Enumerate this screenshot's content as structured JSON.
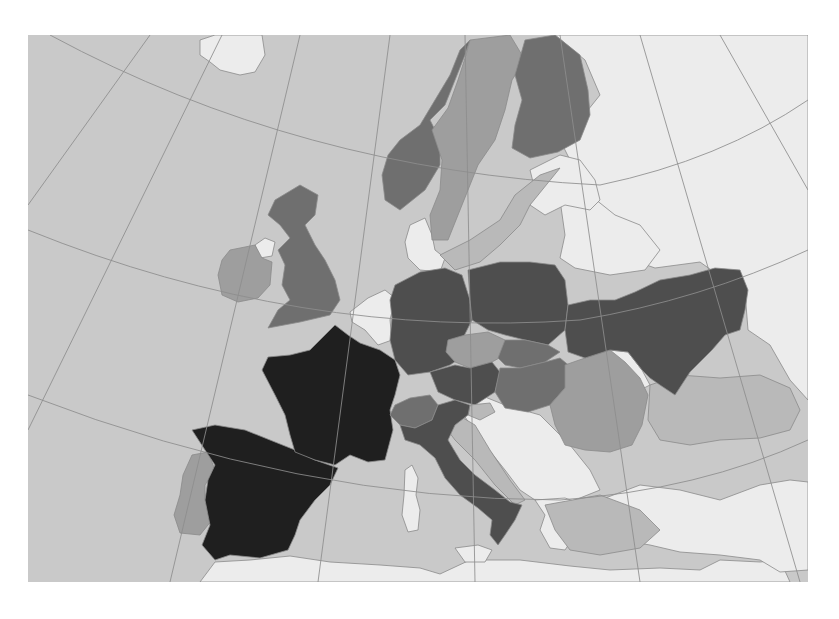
{
  "map": {
    "title": "",
    "region": "Europe",
    "projection": "conic",
    "colors": {
      "sea": "#c9c9c9",
      "no_data": "#ececec",
      "graticule": "#8d8d8d",
      "border": "#8a8a8a"
    },
    "classes": [
      {
        "id": "c5",
        "color": "#1f1f1f"
      },
      {
        "id": "c4",
        "color": "#4e4e4e"
      },
      {
        "id": "c3",
        "color": "#6f6f6f"
      },
      {
        "id": "c2",
        "color": "#9e9e9e"
      },
      {
        "id": "c1",
        "color": "#b9b9b9"
      },
      {
        "id": "none",
        "color": "#ececec"
      }
    ],
    "countries": [
      {
        "id": "france",
        "name": "France",
        "class": "c5"
      },
      {
        "id": "spain",
        "name": "Spain",
        "class": "c5"
      },
      {
        "id": "germany",
        "name": "Germany",
        "class": "c4"
      },
      {
        "id": "poland",
        "name": "Poland",
        "class": "c4"
      },
      {
        "id": "ukraine",
        "name": "Ukraine",
        "class": "c4"
      },
      {
        "id": "austria",
        "name": "Austria",
        "class": "c4"
      },
      {
        "id": "italy",
        "name": "Italy",
        "class": "c4"
      },
      {
        "id": "uk",
        "name": "United Kingdom",
        "class": "c3"
      },
      {
        "id": "norway",
        "name": "Norway",
        "class": "c3"
      },
      {
        "id": "finland",
        "name": "Finland",
        "class": "c3"
      },
      {
        "id": "hungary",
        "name": "Hungary",
        "class": "c3"
      },
      {
        "id": "slovakia",
        "name": "Slovakia",
        "class": "c3"
      },
      {
        "id": "switzerland",
        "name": "Switzerland",
        "class": "c3"
      },
      {
        "id": "ireland",
        "name": "Ireland",
        "class": "c2"
      },
      {
        "id": "sweden",
        "name": "Sweden",
        "class": "c2"
      },
      {
        "id": "czechia",
        "name": "Czechia",
        "class": "c2"
      },
      {
        "id": "romania",
        "name": "Romania",
        "class": "c2"
      },
      {
        "id": "portugal",
        "name": "Portugal",
        "class": "c2"
      },
      {
        "id": "slovenia",
        "name": "Slovenia",
        "class": "c1"
      },
      {
        "id": "black-sea",
        "name": "Black Sea",
        "class": "c1"
      },
      {
        "id": "baltic-sea",
        "name": "Baltic Sea",
        "class": "c1"
      },
      {
        "id": "adriatic",
        "name": "Adriatic Sea",
        "class": "c1"
      },
      {
        "id": "med-east",
        "name": "Eastern Mediterranean",
        "class": "c1"
      },
      {
        "id": "iceland",
        "name": "Iceland",
        "class": "none"
      },
      {
        "id": "northern-ireland",
        "name": "Northern Ireland",
        "class": "none"
      },
      {
        "id": "benelux",
        "name": "Benelux",
        "class": "none"
      },
      {
        "id": "denmark",
        "name": "Denmark",
        "class": "none"
      },
      {
        "id": "baltics",
        "name": "Baltic states",
        "class": "none"
      },
      {
        "id": "belarus",
        "name": "Belarus",
        "class": "none"
      },
      {
        "id": "russia",
        "name": "Russia",
        "class": "none"
      },
      {
        "id": "moldova",
        "name": "Moldova",
        "class": "none"
      },
      {
        "id": "balkans",
        "name": "Balkans",
        "class": "none"
      },
      {
        "id": "greece",
        "name": "Greece",
        "class": "none"
      },
      {
        "id": "turkey",
        "name": "Turkey",
        "class": "none"
      },
      {
        "id": "north-africa",
        "name": "North Africa",
        "class": "none"
      },
      {
        "id": "corsica-sardinia",
        "name": "Corsica & Sardinia",
        "class": "none"
      },
      {
        "id": "sicily",
        "name": "Sicily",
        "class": "none"
      }
    ]
  }
}
